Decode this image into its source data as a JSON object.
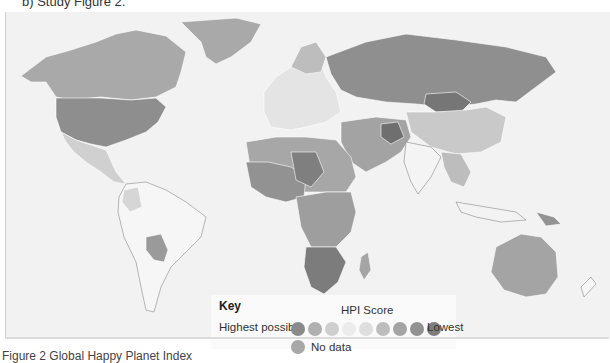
{
  "question": "b) Study Figure 2.",
  "caption": "Figure 2 Global Happy Planet Index",
  "key": {
    "title": "Key",
    "subtitle": "HPI Score",
    "high_label": "Highest possible",
    "low_label": "Lowest",
    "no_data_label": "No data",
    "scale_colors": [
      "#8a8a8a",
      "#b0b0b0",
      "#cfcfcf",
      "#ececec",
      "#dedede",
      "#bdbdbd",
      "#a4a4a4",
      "#929292",
      "#7e7e7e"
    ],
    "no_data_color": "#a8a8a8"
  },
  "map": {
    "colors": {
      "north_america_canada": "#a9a9a9",
      "usa": "#8e8e8e",
      "greenland": "#a9a9a9",
      "central_america": "#d0d0d0",
      "south_america": "#f6f6f6",
      "bolivia_paraguay": "#9a9a9a",
      "europe": "#e4e4e4",
      "russia": "#8f8f8f",
      "mongolia": "#767676",
      "china": "#c9c9c9",
      "india": "#f4f4f4",
      "middle_east": "#a3a3a3",
      "north_africa": "#a7a7a7",
      "west_africa": "#929292",
      "central_africa": "#9e9e9e",
      "southern_africa": "#7c7c7c",
      "australia": "#a4a4a4",
      "ocean": "#f2f2f2"
    }
  }
}
